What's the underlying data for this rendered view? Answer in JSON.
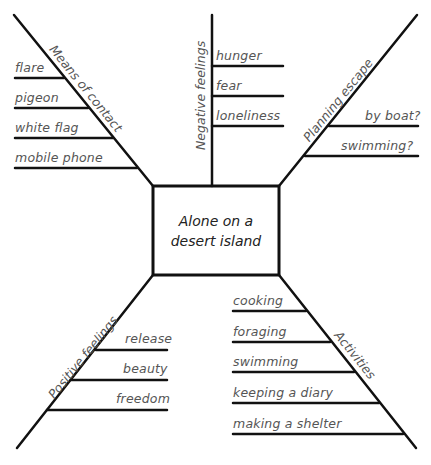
{
  "center": {
    "line1": "Alone on a",
    "line2": "desert island"
  },
  "branches": [
    {
      "id": "means-of-contact",
      "label": "Means of contact",
      "items": [
        "flare",
        "pigeon",
        "white flag",
        "mobile phone"
      ]
    },
    {
      "id": "negative-feelings",
      "label": "Negative feelings",
      "items": [
        "hunger",
        "fear",
        "loneliness"
      ]
    },
    {
      "id": "planning-escape",
      "label": "Planning escape",
      "items": [
        "by boat?",
        "swimming?"
      ]
    },
    {
      "id": "positive-feelings",
      "label": "Positive feelings",
      "items": [
        "release",
        "beauty",
        "freedom"
      ]
    },
    {
      "id": "activities",
      "label": "Activities",
      "items": [
        "cooking",
        "foraging",
        "swimming",
        "keeping a diary",
        "making a shelter"
      ]
    }
  ]
}
